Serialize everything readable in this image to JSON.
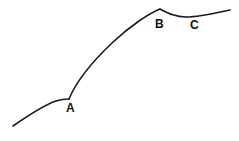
{
  "figure": {
    "background_color": "#ffffff",
    "stroke_color": "#1a1a1a",
    "stroke_width": 1.6,
    "width": 239,
    "height": 141
  },
  "labels": {
    "a": "A",
    "b": "B",
    "c": "C"
  },
  "chart_data": {
    "type": "line",
    "title": "",
    "xlabel": "",
    "ylabel": "",
    "xlim": [
      0,
      239
    ],
    "ylim": [
      141,
      0
    ],
    "grid": false,
    "legend": "none",
    "annotations": [
      {
        "text": "A",
        "x": 69,
        "y": 99,
        "label_x": 66,
        "label_y": 102,
        "kind": "cusp-corner"
      },
      {
        "text": "B",
        "x": 160,
        "y": 9,
        "label_x": 155,
        "label_y": 18,
        "kind": "apex-corner"
      },
      {
        "text": "C",
        "x": 194,
        "y": 16,
        "label_x": 190,
        "label_y": 19,
        "kind": "trough-inflection"
      }
    ],
    "series": [
      {
        "name": "curve",
        "x": [
          13,
          25,
          40,
          55,
          69,
          74,
          82,
          92,
          104,
          118,
          132,
          146,
          160,
          168,
          176,
          185,
          196,
          210,
          222,
          230
        ],
        "y": [
          126,
          118,
          109,
          103,
          99,
          88,
          76,
          65,
          55,
          44,
          33,
          20,
          9,
          12,
          15,
          17,
          16,
          13,
          11,
          10
        ]
      }
    ],
    "path_segments": [
      {
        "name": "lower-left-arc",
        "from": "start",
        "to": "A",
        "d": "M 13 126 C 26 117 44 105 56 101 C 62 99 66 99 69 99"
      },
      {
        "name": "rising-arc",
        "from": "A",
        "to": "B",
        "d": "M 69 99 C 76 82 92 62 112 43 C 131 25 150 13 160 9"
      },
      {
        "name": "dip-and-rise",
        "from": "B",
        "to": "end",
        "d": "M 160 9 C 168 13 175 17 186 17 C 200 17 216 13 230 10"
      }
    ]
  }
}
